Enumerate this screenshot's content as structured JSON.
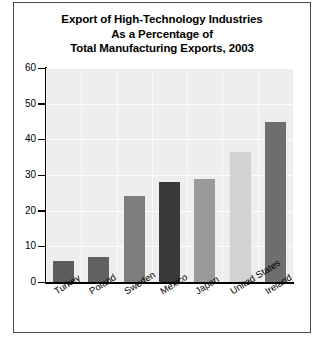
{
  "chart_data": {
    "type": "bar",
    "title": "Export of High-Technology Industries As a Percentage of Total Manufacturing Exports, 2003",
    "title_lines": [
      "Export of High-Technology Industries",
      "As a Percentage of",
      "Total Manufacturing Exports, 2003"
    ],
    "categories": [
      "Turkey",
      "Poland",
      "Sweden",
      "Mexico",
      "Japan",
      "United States",
      "Ireland"
    ],
    "values": [
      6,
      7,
      24,
      28,
      29,
      36.5,
      45
    ],
    "bar_colors": [
      "#5d5d5d",
      "#616161",
      "#7d7d7d",
      "#3a3a3a",
      "#9a9a9a",
      "#d2d2d2",
      "#6e6e6e"
    ],
    "xlabel": "",
    "ylabel": "",
    "ylim": [
      0,
      60
    ],
    "yticks": [
      0,
      10,
      20,
      30,
      40,
      50,
      60
    ],
    "ytick_labels": [
      "0",
      "10",
      "20",
      "30",
      "40",
      "50",
      "60"
    ],
    "grid": true,
    "legend": "none",
    "plot_background": "#eeeeee"
  }
}
